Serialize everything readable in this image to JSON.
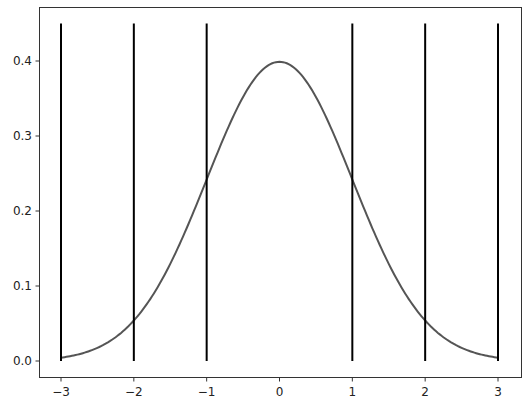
{
  "chart_data": {
    "type": "line",
    "title": "",
    "xlabel": "",
    "ylabel": "",
    "xlim": [
      -3.3,
      3.3
    ],
    "ylim": [
      -0.0225,
      0.4725
    ],
    "grid": false,
    "x_ticks": [
      "-3",
      "-2",
      "-1",
      "0",
      "1",
      "2",
      "3"
    ],
    "y_ticks": [
      "0.0",
      "0.1",
      "0.2",
      "0.3",
      "0.4"
    ],
    "series": [
      {
        "name": "normal pdf",
        "color": "#555555",
        "x_range": [
          -3,
          3
        ],
        "function": "standard normal density"
      }
    ],
    "vlines": {
      "x": [
        -3,
        -2,
        -1,
        1,
        2,
        3
      ],
      "ymin": 0,
      "ymax": 0.45,
      "color": "#000000"
    }
  }
}
